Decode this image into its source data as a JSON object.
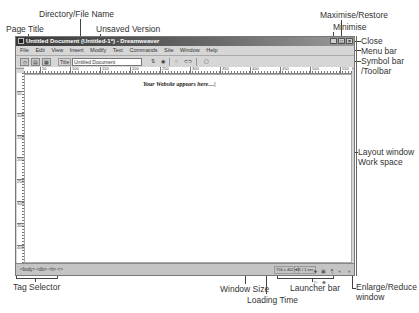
{
  "annotations": {
    "page_title": "Page Title",
    "directory_file_name": "Directory/File Name",
    "unsaved_version": "Unsaved Version",
    "minimise": "Minimise",
    "maximise_restore": "Maximise/Restore",
    "close": "Close",
    "menu_bar": "Menu bar",
    "symbol_bar_1": "Symbol bar",
    "symbol_bar_2": "/Toolbar",
    "layout_window_1": "Layout window",
    "layout_window_2": "Work space",
    "tag_selector": "Tag Selector",
    "window_size": "Window Size",
    "loading_time": "Loading Time",
    "launcher_bar": "Launcher bar",
    "enlarge_reduce_1": "Enlarge/Reduce",
    "enlarge_reduce_2": "window"
  },
  "window": {
    "title": "Untitled Document (Untitled-1*) - Dreamweaver",
    "buttons": {
      "minimise": "_",
      "maximise": "□",
      "close": "×"
    }
  },
  "menu": [
    "File",
    "Edit",
    "View",
    "Insert",
    "Modify",
    "Text",
    "Commands",
    "Site",
    "Window",
    "Help"
  ],
  "toolbar": {
    "title_label": "Title",
    "title_value": "Untitled Document",
    "icons": [
      "code-view-icon",
      "split-view-icon",
      "design-view-icon",
      "file-management-icon",
      "preview-icon",
      "refresh-icon",
      "reference-icon",
      "view-options-icon"
    ]
  },
  "ruler": {
    "h_ticks": [
      "50",
      "100",
      "150",
      "200",
      "250",
      "300",
      "350",
      "400",
      "450",
      "500",
      "550"
    ],
    "v_ticks": [
      "50",
      "100",
      "150",
      "200",
      "250",
      "300",
      "350",
      "400"
    ]
  },
  "workspace": {
    "placeholder": "Your Website appears here....|"
  },
  "status": {
    "tag_selector": "<body> <div> <h> <>",
    "window_size": "756 x 402 ▾",
    "loading_time": "1K / 1 sec",
    "launcher_icons": [
      "site-icon",
      "assets-icon",
      "html-styles-icon",
      "css-styles-icon",
      "behaviors-icon",
      "history-icon",
      "code-inspector-icon"
    ]
  }
}
